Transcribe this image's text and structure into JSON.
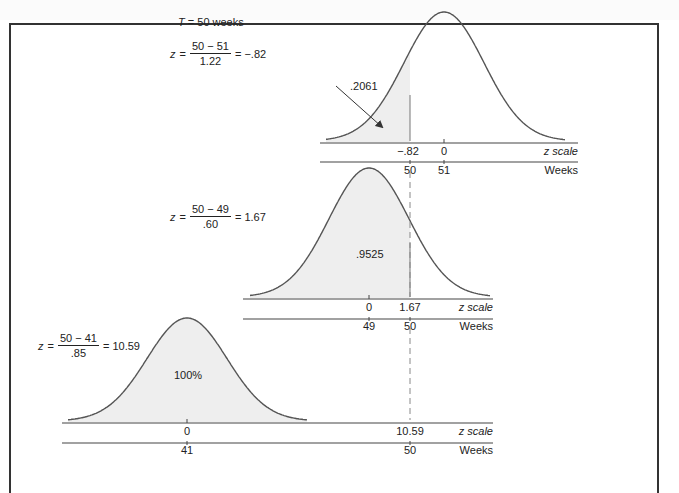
{
  "figure": {
    "title_T": "T",
    "title_rest": " = 50 weeks",
    "colors": {
      "curve": "#555555",
      "fill": "#eeeeee",
      "axis": "#444444",
      "dash": "#888888"
    }
  },
  "panels": [
    {
      "id": "top",
      "equation": {
        "lhs": "z",
        "eq": "=",
        "numerator": "50 − 51",
        "denominator": "1.22",
        "result": "= −.82"
      },
      "area_label": ".2061",
      "z_ticks": [
        "−.82",
        "0"
      ],
      "week_ticks": [
        "50",
        "51"
      ],
      "z_axis_label": "z scale",
      "week_axis_label": "Weeks"
    },
    {
      "id": "middle",
      "equation": {
        "lhs": "z",
        "eq": "=",
        "numerator": "50 − 49",
        "denominator": ".60",
        "result": "= 1.67"
      },
      "area_label": ".9525",
      "z_ticks": [
        "0",
        "1.67"
      ],
      "week_ticks": [
        "49",
        "50"
      ],
      "z_axis_label": "z scale",
      "week_axis_label": "Weeks"
    },
    {
      "id": "bottom",
      "equation": {
        "lhs": "z",
        "eq": "=",
        "numerator": "50 − 41",
        "denominator": ".85",
        "result": "= 10.59"
      },
      "area_label": "100%",
      "z_ticks": [
        "0",
        "10.59"
      ],
      "week_ticks": [
        "41",
        "50"
      ],
      "z_axis_label": "z scale",
      "week_axis_label": "Weeks"
    }
  ]
}
